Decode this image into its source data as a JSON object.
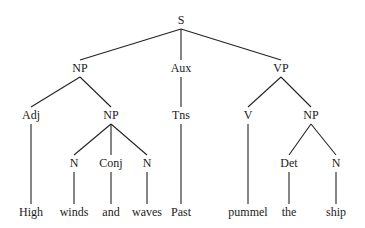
{
  "diagram": {
    "type": "syntax-tree",
    "nodes": [
      {
        "id": "S",
        "label": "S",
        "x": 181,
        "y": 20
      },
      {
        "id": "NP1",
        "label": "NP",
        "x": 80,
        "y": 68
      },
      {
        "id": "Aux",
        "label": "Aux",
        "x": 181,
        "y": 68
      },
      {
        "id": "VP",
        "label": "VP",
        "x": 281,
        "y": 68
      },
      {
        "id": "Adj",
        "label": "Adj",
        "x": 31,
        "y": 115
      },
      {
        "id": "NP2",
        "label": "NP",
        "x": 111,
        "y": 115
      },
      {
        "id": "Tns",
        "label": "Tns",
        "x": 181,
        "y": 115
      },
      {
        "id": "V",
        "label": "V",
        "x": 248,
        "y": 115
      },
      {
        "id": "NP3",
        "label": "NP",
        "x": 311,
        "y": 115
      },
      {
        "id": "N1",
        "label": "N",
        "x": 74,
        "y": 163
      },
      {
        "id": "Conj",
        "label": "Conj",
        "x": 111,
        "y": 163
      },
      {
        "id": "N2",
        "label": "N",
        "x": 147,
        "y": 163
      },
      {
        "id": "Det",
        "label": "Det",
        "x": 289,
        "y": 163
      },
      {
        "id": "N3",
        "label": "N",
        "x": 336,
        "y": 163
      },
      {
        "id": "w_high",
        "label": "High",
        "x": 31,
        "y": 212
      },
      {
        "id": "w_winds",
        "label": "winds",
        "x": 74,
        "y": 212
      },
      {
        "id": "w_and",
        "label": "and",
        "x": 111,
        "y": 212
      },
      {
        "id": "w_waves",
        "label": "waves",
        "x": 147,
        "y": 212
      },
      {
        "id": "w_past",
        "label": "Past",
        "x": 181,
        "y": 212
      },
      {
        "id": "w_pummel",
        "label": "pummel",
        "x": 248,
        "y": 212
      },
      {
        "id": "w_the",
        "label": "the",
        "x": 289,
        "y": 212
      },
      {
        "id": "w_ship",
        "label": "ship",
        "x": 336,
        "y": 212
      }
    ],
    "edges": [
      [
        "S",
        "NP1"
      ],
      [
        "S",
        "Aux"
      ],
      [
        "S",
        "VP"
      ],
      [
        "NP1",
        "Adj"
      ],
      [
        "NP1",
        "NP2"
      ],
      [
        "Aux",
        "Tns"
      ],
      [
        "VP",
        "V"
      ],
      [
        "VP",
        "NP3"
      ],
      [
        "Adj",
        "w_high"
      ],
      [
        "NP2",
        "N1"
      ],
      [
        "NP2",
        "Conj"
      ],
      [
        "NP2",
        "N2"
      ],
      [
        "Tns",
        "w_past"
      ],
      [
        "V",
        "w_pummel"
      ],
      [
        "NP3",
        "Det"
      ],
      [
        "NP3",
        "N3"
      ],
      [
        "N1",
        "w_winds"
      ],
      [
        "Conj",
        "w_and"
      ],
      [
        "N2",
        "w_waves"
      ],
      [
        "Det",
        "w_the"
      ],
      [
        "N3",
        "w_ship"
      ]
    ],
    "sentence": "High winds and waves Past pummel the ship"
  }
}
